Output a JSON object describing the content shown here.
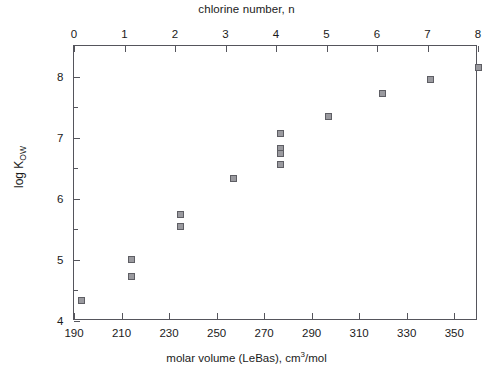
{
  "chart_data": {
    "type": "scatter",
    "title": "",
    "top_axis_title": "chlorine number, n",
    "xlabel": "molar volume (LeBas), cm3/mol",
    "xlabel_main": "molar volume (LeBas), cm",
    "xlabel_sup": "3",
    "xlabel_tail": "/mol",
    "ylabel_main": "log K",
    "ylabel_sub": "OW",
    "xlim": [
      190,
      360
    ],
    "ylim": [
      4,
      8.5
    ],
    "xticks": [
      190,
      210,
      230,
      250,
      270,
      290,
      310,
      330,
      350
    ],
    "yticks": [
      4,
      5,
      6,
      7,
      8
    ],
    "y_minor_ticks": [
      4.5,
      5.5,
      6.5,
      7.5
    ],
    "top_axis_lim": [
      0,
      8
    ],
    "top_ticks": [
      0,
      1,
      2,
      3,
      4,
      5,
      6,
      7,
      8
    ],
    "grid": false,
    "legend": false,
    "marker_face_color": "#9a9a9f",
    "marker_edge_color": "#5e5e64",
    "axis_color": "#55555c",
    "points": [
      {
        "x": 193,
        "y": 4.33,
        "n": 0
      },
      {
        "x": 214,
        "y": 5.0,
        "n": 1
      },
      {
        "x": 214,
        "y": 4.73,
        "n": 1
      },
      {
        "x": 235,
        "y": 5.75,
        "n": 2
      },
      {
        "x": 235,
        "y": 5.55,
        "n": 2
      },
      {
        "x": 257,
        "y": 6.33,
        "n": 3
      },
      {
        "x": 277,
        "y": 7.07,
        "n": 4
      },
      {
        "x": 277,
        "y": 6.83,
        "n": 4
      },
      {
        "x": 277,
        "y": 6.74,
        "n": 4
      },
      {
        "x": 277,
        "y": 6.56,
        "n": 4
      },
      {
        "x": 297,
        "y": 7.35,
        "n": 5
      },
      {
        "x": 320,
        "y": 7.73,
        "n": 6
      },
      {
        "x": 340,
        "y": 7.95,
        "n": 7
      },
      {
        "x": 360,
        "y": 8.15,
        "n": 8
      }
    ]
  }
}
